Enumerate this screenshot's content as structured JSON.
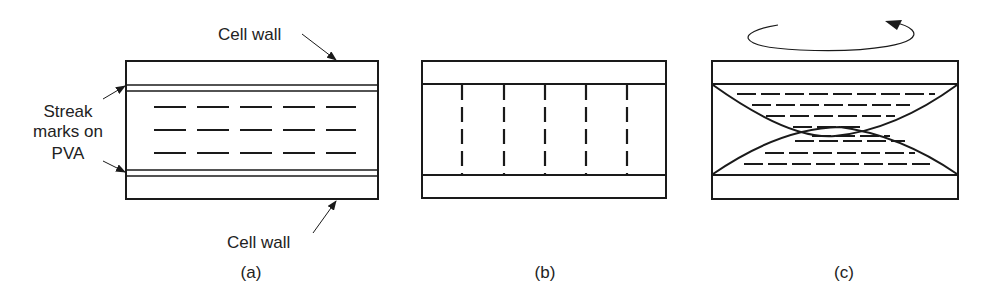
{
  "panels": {
    "a": {
      "caption": "(a)",
      "top_label": "Cell wall",
      "bottom_label": "Cell wall",
      "side_label_lines": [
        "Streak",
        "marks on",
        "PVA"
      ]
    },
    "b": {
      "caption": "(b)"
    },
    "c": {
      "caption": "(c)",
      "rotation_arrow": "counter-clockwise rotation arrow"
    }
  },
  "colors": {
    "stroke": "#1a1a1a",
    "background": "#ffffff",
    "text": "#222222"
  }
}
